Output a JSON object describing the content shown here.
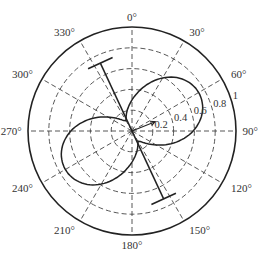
{
  "chart_data": {
    "type": "polar",
    "title": "",
    "center_px": [
      132,
      131
    ],
    "outer_radius_px": 104,
    "rlim": [
      0,
      1
    ],
    "radial_ticks": [
      0.2,
      0.4,
      0.6,
      0.8,
      1
    ],
    "radial_tick_labels": [
      "0.2",
      "0.4",
      "0.6",
      "0.8",
      "1"
    ],
    "radial_label_angle_deg": 70,
    "angular_ticks_deg": [
      0,
      30,
      60,
      90,
      120,
      150,
      180,
      210,
      240,
      270,
      300,
      330
    ],
    "angular_tick_labels": [
      "0°",
      "30°",
      "60°",
      "90°",
      "120°",
      "150°",
      "180°",
      "210°",
      "240°",
      "270°",
      "300°",
      "330°"
    ],
    "theta_zero": "top",
    "theta_direction": "clockwise",
    "grid": {
      "on": true,
      "style": "dashed"
    },
    "series": [
      {
        "name": "radiation pattern",
        "main_lobe_directions_deg": [
          60,
          240
        ],
        "main_lobe_peak": 0.74,
        "minor_lobe_directions_deg": [
          335,
          155
        ],
        "minor_lobe_peak": 0.12
      }
    ],
    "annotations": [
      {
        "type": "dipole-element",
        "from_deg": 335,
        "from_r": 0.72,
        "to_deg": 155,
        "to_r": 0.72,
        "crossbar_half_length": 0.13
      },
      {
        "type": "arrow",
        "angle_deg": 68,
        "r": 0.24
      }
    ]
  }
}
